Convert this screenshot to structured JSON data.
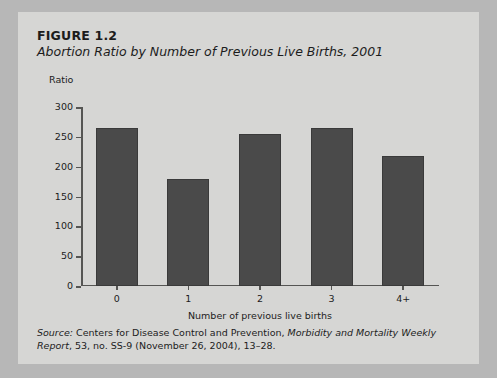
{
  "figure": {
    "number": "FIGURE 1.2",
    "title": "Abortion Ratio by Number of Previous Live Births, 2001"
  },
  "source": {
    "label": "Source:",
    "body_1": " Centers for Disease Control and Prevention, ",
    "publication": "Morbidity and Mortality Weekly Report",
    "body_2": ", 53, no. SS-9 (November 26, 2004), 13–28."
  },
  "colors": {
    "card_background": "#d6d6d4",
    "page_background": "#b7b7b7",
    "bar_fill": "#4a4a4a",
    "axis": "#555553",
    "text": "#1c1c1c"
  },
  "chart_data": {
    "type": "bar",
    "title": "Abortion Ratio by Number of Previous Live Births, 2001",
    "subtitle": "FIGURE 1.2",
    "categories": [
      "0",
      "1",
      "2",
      "3",
      "4+"
    ],
    "values": [
      265,
      180,
      255,
      265,
      218
    ],
    "series": [
      {
        "name": "Abortion ratio",
        "values": [
          265,
          180,
          255,
          265,
          218
        ]
      }
    ],
    "xlabel": "Number of previous live births",
    "ylabel": "Ratio",
    "ylim": [
      0,
      300
    ],
    "yticks": [
      0,
      50,
      100,
      150,
      200,
      250,
      300
    ],
    "ytick_labels": [
      "0",
      "50",
      "100",
      "150",
      "200",
      "250",
      "300"
    ],
    "grid": false,
    "legend": false,
    "legend_position": "none"
  }
}
